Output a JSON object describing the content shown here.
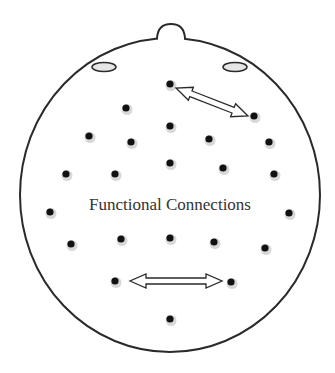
{
  "diagram": {
    "type": "eeg-scalp-topography",
    "center_label": "Functional Connections",
    "colors": {
      "outline": "#2a2a2a",
      "electrode": "#111111",
      "electrode_shadow": "#d8d8d8",
      "ear_fill": "#e6e6e6",
      "arrow_fill": "#ffffff",
      "text": "#333333"
    },
    "head": {
      "cx": 170,
      "cy": 195,
      "rx": 150,
      "ry": 157
    },
    "electrodes": [
      {
        "x": 170,
        "y": 84
      },
      {
        "x": 254,
        "y": 116
      },
      {
        "x": 126,
        "y": 108
      },
      {
        "x": 89,
        "y": 136
      },
      {
        "x": 131,
        "y": 142
      },
      {
        "x": 170,
        "y": 126
      },
      {
        "x": 209,
        "y": 139
      },
      {
        "x": 269,
        "y": 142
      },
      {
        "x": 66,
        "y": 174
      },
      {
        "x": 115,
        "y": 174
      },
      {
        "x": 170,
        "y": 163
      },
      {
        "x": 223,
        "y": 168
      },
      {
        "x": 274,
        "y": 174
      },
      {
        "x": 50,
        "y": 212
      },
      {
        "x": 289,
        "y": 213
      },
      {
        "x": 71,
        "y": 244
      },
      {
        "x": 121,
        "y": 239
      },
      {
        "x": 170,
        "y": 238
      },
      {
        "x": 214,
        "y": 242
      },
      {
        "x": 265,
        "y": 248
      },
      {
        "x": 115,
        "y": 281
      },
      {
        "x": 231,
        "y": 282
      },
      {
        "x": 170,
        "y": 319
      }
    ],
    "connections": [
      {
        "from": [
          176,
          88
        ],
        "to": [
          248,
          116
        ]
      },
      {
        "from": [
          130,
          281
        ],
        "to": [
          222,
          281
        ]
      }
    ]
  }
}
